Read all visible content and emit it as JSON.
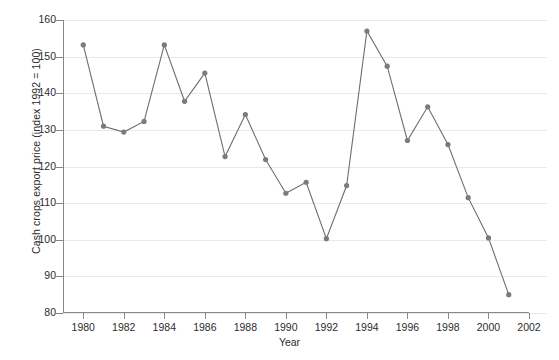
{
  "chart_data": {
    "type": "line",
    "title": "",
    "xlabel": "Year",
    "ylabel": "Cash crops export price (index 1992 = 100)",
    "xlim": [
      1979,
      2002
    ],
    "ylim": [
      80,
      160
    ],
    "yticks": [
      80,
      90,
      100,
      110,
      120,
      130,
      140,
      150,
      160
    ],
    "xticks": [
      1980,
      1982,
      1984,
      1986,
      1988,
      1990,
      1992,
      1994,
      1996,
      1998,
      2000,
      2002
    ],
    "grid": "horizontal",
    "legend": "none",
    "marker": "circle",
    "x": [
      1980,
      1981,
      1982,
      1983,
      1984,
      1985,
      1986,
      1987,
      1988,
      1989,
      1990,
      1991,
      1992,
      1993,
      1994,
      1995,
      1996,
      1997,
      1998,
      1999,
      2000,
      2001
    ],
    "values": [
      153.2,
      131.0,
      129.4,
      132.3,
      153.2,
      137.8,
      145.5,
      122.7,
      134.2,
      121.9,
      112.7,
      115.7,
      100.3,
      114.8,
      157.0,
      147.4,
      127.1,
      136.3,
      126.0,
      111.5,
      100.5,
      85.0
    ],
    "series": [
      {
        "name": "Cash crops export price index",
        "color": "#6e6e72",
        "values": [
          153.2,
          131.0,
          129.4,
          132.3,
          153.2,
          137.8,
          145.5,
          122.7,
          134.2,
          121.9,
          112.7,
          115.7,
          100.3,
          114.8,
          157.0,
          147.4,
          127.1,
          136.3,
          126.0,
          111.5,
          100.5,
          85.0
        ]
      }
    ]
  },
  "axis": {
    "y_tick_labels": [
      "160",
      "150",
      "140",
      "130",
      "120",
      "110",
      "100",
      "90",
      "80"
    ],
    "x_tick_labels": [
      "1980",
      "1982",
      "1984",
      "1986",
      "1988",
      "1990",
      "1992",
      "1994",
      "1996",
      "1998",
      "2000",
      "2002"
    ],
    "y_title": "Cash crops export price (index 1992 = 100)",
    "x_title": "Year"
  },
  "style": {
    "grid_color": "#e9e9ea",
    "axis_color": "#888888",
    "line_color": "#6e6e72",
    "marker_color": "#7a7a7f",
    "text_color": "#2c2c2c",
    "background": "#ffffff"
  }
}
